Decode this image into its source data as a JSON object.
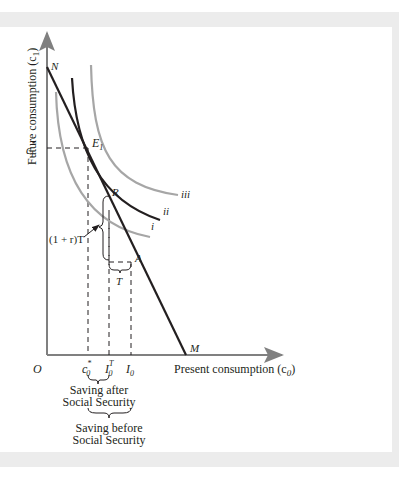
{
  "figure": {
    "y_axis_label": "Future consumption (c",
    "y_axis_sub": "1",
    "y_axis_close": ")",
    "x_axis_label": "Present consumption (c",
    "x_axis_sub": "0",
    "x_axis_close": ")",
    "origin": "O",
    "points": {
      "N": "N",
      "M": "M",
      "E1": "E",
      "E1_sub": "1",
      "R": "R",
      "A": "A"
    },
    "curves": {
      "i": "i",
      "ii": "ii",
      "iii": "iii"
    },
    "y_tick": {
      "main": "c",
      "sub": "1",
      "sup": "*"
    },
    "x_ticks": [
      {
        "main": "c",
        "sub": "0",
        "sup": "*"
      },
      {
        "main": "I",
        "sub": "0",
        "sup": "T"
      },
      {
        "main": "I",
        "sub": "0",
        "sup": ""
      }
    ],
    "annotations": {
      "transfer_future": "(1 + r)T",
      "transfer": "T",
      "saving_after_line1": "Saving after",
      "saving_after_line2": "Social Security",
      "saving_before_line1": "Saving before",
      "saving_before_line2": "Social Security"
    },
    "colors": {
      "axis": "#808080",
      "budget_line": "#231f20",
      "indifference_gray": "#a6a6a6",
      "indifference_black": "#231f20",
      "frame": "#ececec"
    }
  }
}
